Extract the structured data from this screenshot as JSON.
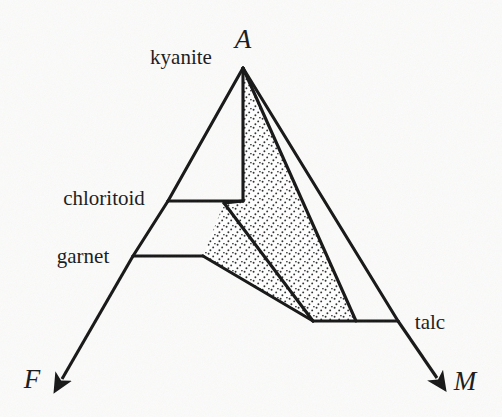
{
  "figure": {
    "kind": "AFM ternary phase diagram",
    "background_color": "#fbfbfa",
    "line_color": "#161616",
    "stipple_color": "#2b2b2b",
    "stipple_fill": "#ffffff"
  },
  "vertices": {
    "apex": {
      "label": "A",
      "x": 243,
      "y": 38
    },
    "left": {
      "label": "F",
      "x": 32,
      "y": 378
    },
    "right": {
      "label": "M",
      "x": 465,
      "y": 380
    }
  },
  "mineral_labels": [
    {
      "name": "kyanite",
      "text": "kyanite",
      "x": 181,
      "y": 57,
      "anchor": "middle"
    },
    {
      "name": "chloritoid",
      "text": "chloritoid",
      "x": 104,
      "y": 198,
      "anchor": "middle"
    },
    {
      "name": "garnet",
      "text": "garnet",
      "x": 83,
      "y": 256,
      "anchor": "middle"
    },
    {
      "name": "talc",
      "text": "talc",
      "x": 430,
      "y": 322,
      "anchor": "middle"
    }
  ],
  "geometry": {
    "a_apex": {
      "x": 243,
      "y": 68
    },
    "f_arrow_tip": {
      "x": 62,
      "y": 382
    },
    "m_arrow_tip": {
      "x": 440,
      "y": 382
    },
    "chloritoid_pt": {
      "x": 168,
      "y": 201
    },
    "garnet_pt": {
      "x": 133,
      "y": 256
    },
    "talc_pt": {
      "x": 398,
      "y": 321
    },
    "ctd_inner": {
      "x": 243,
      "y": 201
    },
    "ctd_node": {
      "x": 224,
      "y": 203
    },
    "grt_inner": {
      "x": 203,
      "y": 256
    },
    "base_left": {
      "x": 313,
      "y": 321
    },
    "base_mid": {
      "x": 356,
      "y": 321
    }
  },
  "stipple_regions": [
    {
      "name": "upper-stipple-field",
      "points": "243,68 243,201 224,203 313,321 356,321"
    },
    {
      "name": "lower-stipple-field",
      "points": "224,203 203,256 313,321"
    }
  ],
  "tie_lines": [
    {
      "name": "kyanite-edge-left",
      "x1": 243,
      "y1": 68,
      "x2": 168,
      "y2": 201
    },
    {
      "name": "a-f-join",
      "x1": 168,
      "y1": 201,
      "x2": 133,
      "y2": 256
    },
    {
      "name": "f-arrow-shaft",
      "x1": 133,
      "y1": 256,
      "x2": 62,
      "y2": 382
    },
    {
      "name": "chloritoid-tie",
      "x1": 168,
      "y1": 201,
      "x2": 243,
      "y2": 201
    },
    {
      "name": "garnet-tie",
      "x1": 133,
      "y1": 256,
      "x2": 203,
      "y2": 256
    },
    {
      "name": "a-vertical",
      "x1": 243,
      "y1": 68,
      "x2": 243,
      "y2": 201
    },
    {
      "name": "ctd-to-base",
      "x1": 224,
      "y1": 203,
      "x2": 313,
      "y2": 321
    },
    {
      "name": "grt-to-base",
      "x1": 203,
      "y1": 256,
      "x2": 313,
      "y2": 321
    },
    {
      "name": "a-to-basemid",
      "x1": 243,
      "y1": 68,
      "x2": 356,
      "y2": 321
    },
    {
      "name": "a-to-talc",
      "x1": 243,
      "y1": 68,
      "x2": 398,
      "y2": 321
    },
    {
      "name": "base-tie",
      "x1": 313,
      "y1": 321,
      "x2": 398,
      "y2": 321
    },
    {
      "name": "m-arrow-shaft",
      "x1": 398,
      "y1": 321,
      "x2": 440,
      "y2": 382
    }
  ]
}
